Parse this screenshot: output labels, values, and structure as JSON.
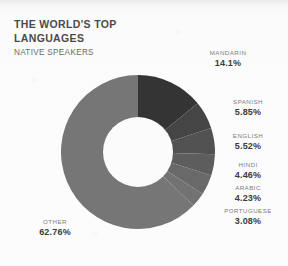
{
  "header": {
    "title": "THE WORLD'S TOP\nLANGUAGES",
    "subtitle": "NATIVE SPEAKERS"
  },
  "chart_data": {
    "type": "pie",
    "variant": "donut",
    "title": "THE WORLD'S TOP LANGUAGES",
    "subtitle": "NATIVE SPEAKERS",
    "unit": "percent",
    "value_suffix": "%",
    "start_angle_deg": 0,
    "direction": "clockwise",
    "legend": "callout-labels",
    "grid": false,
    "categories": [
      "MANDARIN",
      "SPANISH",
      "ENGLISH",
      "HINDI",
      "ARABIC",
      "PORTUGUESE",
      "OTHER"
    ],
    "values": [
      14.1,
      5.85,
      5.52,
      4.46,
      4.23,
      3.08,
      62.76
    ],
    "labels": [
      "14.1%",
      "5.85%",
      "5.52%",
      "4.46%",
      "4.23%",
      "3.08%",
      "62.76%"
    ],
    "colors": [
      "#343434",
      "#454545",
      "#525252",
      "#5d5d5d",
      "#696969",
      "#727272",
      "#767676"
    ],
    "slices": [
      {
        "name": "MANDARIN",
        "value": 14.1,
        "label": "14.1%",
        "color": "#343434"
      },
      {
        "name": "SPANISH",
        "value": 5.85,
        "label": "5.85%",
        "color": "#454545"
      },
      {
        "name": "ENGLISH",
        "value": 5.52,
        "label": "5.52%",
        "color": "#525252"
      },
      {
        "name": "HINDI",
        "value": 4.46,
        "label": "4.46%",
        "color": "#5d5d5d"
      },
      {
        "name": "ARABIC",
        "value": 4.23,
        "label": "4.23%",
        "color": "#696969"
      },
      {
        "name": "PORTUGUESE",
        "value": 3.08,
        "label": "3.08%",
        "color": "#727272"
      },
      {
        "name": "OTHER",
        "value": 62.76,
        "label": "62.76%",
        "color": "#767676"
      }
    ]
  },
  "geometry": {
    "cx": 138,
    "cy": 152,
    "outer_r": 77,
    "inner_r": 35,
    "hole_color": "#fbfbfb"
  },
  "callouts": [
    {
      "key": "mandarin",
      "name": "MANDARIN",
      "value": "14.1%",
      "left": 228,
      "top": 50,
      "align": "center"
    },
    {
      "key": "spanish",
      "name": "SPANISH",
      "value": "5.85%",
      "left": 248,
      "top": 99,
      "align": "center"
    },
    {
      "key": "english",
      "name": "ENGLISH",
      "value": "5.52%",
      "left": 248,
      "top": 133,
      "align": "center"
    },
    {
      "key": "hindi",
      "name": "HINDI",
      "value": "4.46%",
      "left": 248,
      "top": 162,
      "align": "center"
    },
    {
      "key": "arabic",
      "name": "ARABIC",
      "value": "4.23%",
      "left": 248,
      "top": 185,
      "align": "center"
    },
    {
      "key": "portuguese",
      "name": "PORTUGUESE",
      "value": "3.08%",
      "left": 248,
      "top": 208,
      "align": "center"
    },
    {
      "key": "other",
      "name": "OTHER",
      "value": "62.76%",
      "left": 55,
      "top": 219,
      "align": "center"
    }
  ]
}
